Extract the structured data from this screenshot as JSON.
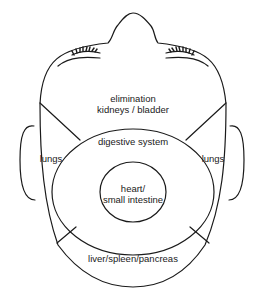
{
  "diagram": {
    "line_color": "#1a1a1a",
    "background": "#ffffff",
    "zones": {
      "forehead": {
        "line1": "elimination",
        "line2": "kidneys / bladder"
      },
      "left_cheek": {
        "label": "lungs"
      },
      "right_cheek": {
        "label": "lungs"
      },
      "middle_ring": {
        "label": "digestive system"
      },
      "center": {
        "line1": "heart/",
        "line2": "small intestine"
      },
      "chin": {
        "label": "liver/spleen/pancreas"
      }
    }
  }
}
